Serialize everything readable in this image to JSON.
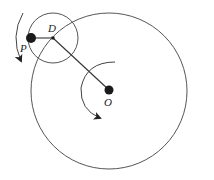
{
  "diagram": {
    "colors": {
      "stroke": "#555555",
      "dot": "#1a1a1a",
      "background": "#ffffff"
    },
    "labels": {
      "P": "P",
      "D": "D",
      "O": "O"
    },
    "rotation_arrows": [
      {
        "around": "D",
        "direction": "counterclockwise"
      },
      {
        "around": "O",
        "direction": "counterclockwise"
      }
    ]
  }
}
